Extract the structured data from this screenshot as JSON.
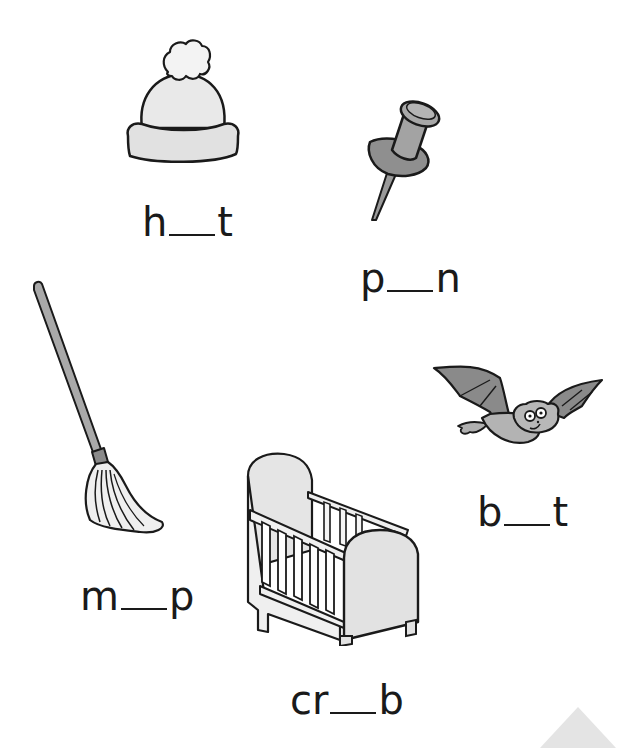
{
  "worksheet": {
    "items": [
      {
        "id": "hat",
        "picture": "hat-picture",
        "prefix": "h",
        "suffix": "t"
      },
      {
        "id": "pin",
        "picture": "pushpin-picture",
        "prefix": "p",
        "suffix": "n"
      },
      {
        "id": "mop",
        "picture": "mop-picture",
        "prefix": "m",
        "suffix": "p"
      },
      {
        "id": "bat",
        "picture": "bat-picture",
        "prefix": "b",
        "suffix": "t"
      },
      {
        "id": "crib",
        "picture": "crib-picture",
        "prefix": "cr",
        "suffix": "b"
      }
    ]
  },
  "colors": {
    "ink": "#1a1a1a",
    "light_fill": "#e8e8e8",
    "mid_fill": "#a8a8a8",
    "dark_fill": "#8c8c8c",
    "corner_triangle": "#e4e4e4"
  }
}
